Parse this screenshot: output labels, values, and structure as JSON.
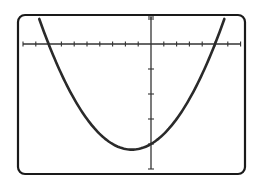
{
  "chart_data": {
    "type": "line",
    "title": "",
    "xlabel": "",
    "ylabel": "",
    "function": "y = x^2 + 3x - 40",
    "series": [
      {
        "name": "parabola",
        "x": [
          -8.73,
          -8,
          -7,
          -6,
          -5,
          -4,
          -3,
          -2,
          -1.5,
          -1,
          0,
          1,
          2,
          3,
          4,
          5,
          5.73
        ],
        "values": [
          10,
          0,
          -12,
          -22,
          -30,
          -36,
          -40,
          -42,
          -42.25,
          -42,
          -40,
          -36,
          -30,
          -22,
          -12,
          0,
          10
        ]
      }
    ],
    "x_intercepts": [
      -8,
      5
    ],
    "y_intercept": -40,
    "vertex": [
      -1.5,
      -42.25
    ],
    "xlim": [
      -10,
      7
    ],
    "ylim": [
      -50,
      10
    ],
    "xscale": 1,
    "yscale": 10,
    "grid": false,
    "tick_labels": false,
    "legend": null
  },
  "colors": {
    "frame": "#1a1a1a",
    "axes": "#333333",
    "curve": "#2a2a2a",
    "background": "#ffffff"
  }
}
